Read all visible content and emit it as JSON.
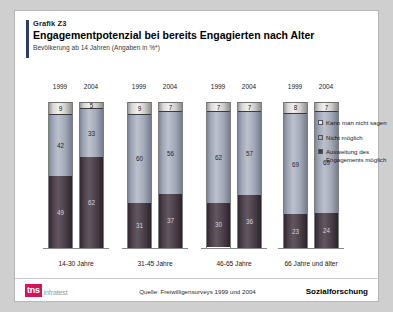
{
  "header": {
    "kicker": "Grafik Z3",
    "title": "Engagementpotenzial bei bereits Engagierten nach Alter",
    "subtitle": "Bevölkerung ab 14 Jahren (Angaben in %*)"
  },
  "footer": {
    "logo_mark": "tns",
    "logo_word": "infratest",
    "source": "Quelle: Freiwilligensurveys 1999 und 2004",
    "department": "Sozialforschung"
  },
  "legend": [
    {
      "label": "Kann man nicht sagen",
      "color": "#e6e4e2"
    },
    {
      "label": "Nicht möglich",
      "color": "#a8aebd"
    },
    {
      "label": "Ausweitung des Engagements möglich",
      "color": "#463c45"
    }
  ],
  "chart_data": {
    "type": "bar",
    "stacked": true,
    "title": "Engagementpotenzial bei bereits Engagierten nach Alter",
    "subtitle": "Bevölkerung ab 14 Jahren (Angaben in %*)",
    "xlabel": "",
    "ylabel": "",
    "ylim": [
      0,
      100
    ],
    "grid": false,
    "legend_position": "right",
    "categories": [
      "14-30 Jahre",
      "31-45 Jahre",
      "46-65 Jahre",
      "66 Jahre und älter"
    ],
    "subcategories": [
      "1999",
      "2004"
    ],
    "series": [
      {
        "name": "Ausweitung des Engagements möglich",
        "color": "#463c45",
        "values": [
          [
            49,
            62
          ],
          [
            31,
            37
          ],
          [
            30,
            36
          ],
          [
            23,
            24
          ]
        ]
      },
      {
        "name": "Nicht möglich",
        "color": "#a8aebd",
        "values": [
          [
            42,
            33
          ],
          [
            60,
            56
          ],
          [
            62,
            57
          ],
          [
            69,
            69
          ]
        ]
      },
      {
        "name": "Kann man nicht sagen",
        "color": "#e6e4e2",
        "values": [
          [
            9,
            5
          ],
          [
            9,
            7
          ],
          [
            7,
            7
          ],
          [
            8,
            7
          ]
        ]
      }
    ],
    "groups": [
      {
        "category": "14-30 Jahre",
        "bars": [
          {
            "year": "1999",
            "bottom": 49,
            "middle": 42,
            "top": 9
          },
          {
            "year": "2004",
            "bottom": 62,
            "middle": 33,
            "top": 5
          }
        ]
      },
      {
        "category": "31-45 Jahre",
        "bars": [
          {
            "year": "1999",
            "bottom": 31,
            "middle": 60,
            "top": 9
          },
          {
            "year": "2004",
            "bottom": 37,
            "middle": 56,
            "top": 7
          }
        ]
      },
      {
        "category": "46-65 Jahre",
        "bars": [
          {
            "year": "1999",
            "bottom": 30,
            "middle": 62,
            "top": 7
          },
          {
            "year": "2004",
            "bottom": 36,
            "middle": 57,
            "top": 7
          }
        ]
      },
      {
        "category": "66 Jahre und älter",
        "bars": [
          {
            "year": "1999",
            "bottom": 23,
            "middle": 69,
            "top": 8
          },
          {
            "year": "2004",
            "bottom": 24,
            "middle": 69,
            "top": 7
          }
        ]
      }
    ]
  }
}
